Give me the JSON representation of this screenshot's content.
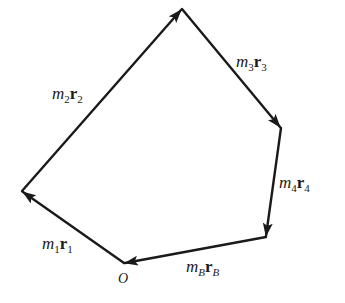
{
  "diagram": {
    "type": "vector-polygon",
    "stroke_color": "#1a1a1a",
    "origin_label": "O",
    "vertices": {
      "O": [
        124,
        263
      ],
      "P1": [
        22,
        191
      ],
      "P2": [
        182,
        9
      ],
      "P3": [
        281,
        128
      ],
      "P4": [
        266,
        237
      ]
    },
    "vectors": [
      {
        "id": "v1",
        "from": "O",
        "to": "P1",
        "mass": "m",
        "mass_sub": "1",
        "vec": "r",
        "vec_sub": "1"
      },
      {
        "id": "v2",
        "from": "P1",
        "to": "P2",
        "mass": "m",
        "mass_sub": "2",
        "vec": "r",
        "vec_sub": "2"
      },
      {
        "id": "v3",
        "from": "P2",
        "to": "P3",
        "mass": "m",
        "mass_sub": "3",
        "vec": "r",
        "vec_sub": "3"
      },
      {
        "id": "v4",
        "from": "P3",
        "to": "P4",
        "mass": "m",
        "mass_sub": "4",
        "vec": "r",
        "vec_sub": "4"
      },
      {
        "id": "vB",
        "from": "P4",
        "to": "O",
        "mass": "m",
        "mass_sub": "B",
        "vec": "r",
        "vec_sub": "B"
      }
    ]
  }
}
